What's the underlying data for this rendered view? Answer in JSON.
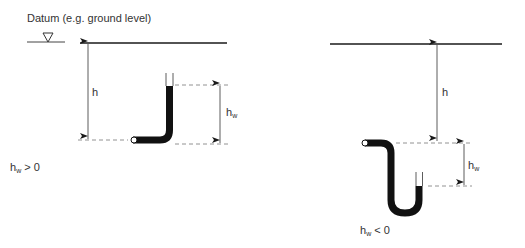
{
  "datum": {
    "label": "Datum (e.g. ground level)"
  },
  "left_case": {
    "depth_label": "h",
    "head_label_main": "h",
    "head_label_sub": "w",
    "condition_main": "h",
    "condition_sub": "w",
    "condition_rest": " > 0"
  },
  "right_case": {
    "depth_label": "h",
    "head_label_main": "h",
    "head_label_sub": "w",
    "condition_main": "h",
    "condition_sub": "w",
    "condition_rest": " < 0"
  },
  "colors": {
    "line": "#1a1a1a",
    "dashed": "#777777",
    "text": "#333333"
  }
}
